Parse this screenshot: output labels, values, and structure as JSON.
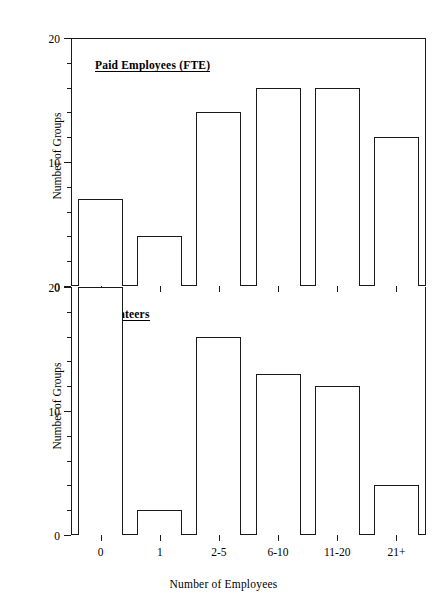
{
  "figure": {
    "top_caption": "",
    "background_color": "#ffffff",
    "line_color": "#1a1a1a"
  },
  "chart_data": [
    {
      "type": "bar",
      "title": "Paid Employees (FTE)",
      "panel": "top",
      "categories": [
        "0",
        "1",
        "2-5",
        "6-10",
        "11-20",
        "21+"
      ],
      "values": [
        7,
        4,
        14,
        16,
        16,
        12
      ],
      "xlabel": "",
      "ylabel": "Number of Groups",
      "ylim": [
        0,
        20
      ],
      "yticks": [
        0,
        10,
        20
      ],
      "yticklabels": [
        "0",
        "10",
        "20"
      ],
      "grid": false,
      "legend": false
    },
    {
      "type": "bar",
      "title": "Volunteers",
      "panel": "bottom",
      "categories": [
        "0",
        "1",
        "2-5",
        "6-10",
        "11-20",
        "21+"
      ],
      "values": [
        20,
        2,
        16,
        13,
        12,
        4
      ],
      "xlabel": "Number of Employees",
      "ylabel": "Number of Groups",
      "ylim": [
        0,
        20
      ],
      "yticks": [
        0,
        10,
        20
      ],
      "yticklabels": [
        "0",
        "10",
        "20"
      ],
      "grid": false,
      "legend": false
    }
  ],
  "axes": {
    "x_axis_title": "Number of Employees",
    "y_axis_title": "Number of Groups",
    "category_labels": [
      "0",
      "1",
      "2-5",
      "6-10",
      "11-20",
      "21+"
    ],
    "y_tick_labels_top": [
      "0",
      "10",
      "20"
    ],
    "y_tick_labels_bottom": [
      "0",
      "10",
      "20"
    ]
  },
  "titles": {
    "top_panel": "Paid Employees (FTE)",
    "bottom_panel": "Volunteers"
  }
}
